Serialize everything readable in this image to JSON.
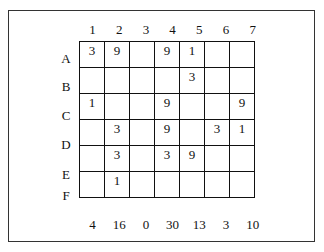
{
  "columns": [
    "1",
    "2",
    "3",
    "4",
    "5",
    "6",
    "7"
  ],
  "rows": [
    {
      "label": "A",
      "cells": [
        "3",
        "9",
        "",
        "9",
        "1",
        "",
        ""
      ]
    },
    {
      "label": "B",
      "cells": [
        "",
        "",
        "",
        "",
        "3",
        "",
        ""
      ]
    },
    {
      "label": "C",
      "cells": [
        "1",
        "",
        "",
        "9",
        "",
        "",
        "9"
      ]
    },
    {
      "label": "D",
      "cells": [
        "",
        "3",
        "",
        "9",
        "",
        "3",
        "1"
      ]
    },
    {
      "label": "E",
      "cells": [
        "",
        "3",
        "",
        "3",
        "9",
        "",
        ""
      ]
    },
    {
      "label": "F",
      "cells": [
        "",
        "1",
        "",
        "",
        "",
        "",
        ""
      ]
    }
  ],
  "totals": [
    "4",
    "16",
    "0",
    "30",
    "13",
    "3",
    "10"
  ]
}
